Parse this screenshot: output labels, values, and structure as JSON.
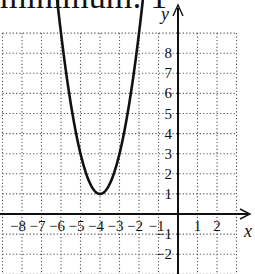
{
  "caption": "minimum: 1",
  "chart_data": {
    "type": "line",
    "title": "",
    "function": "y = 2(x + 4)^2 + 1",
    "vertex": [
      -4,
      1
    ],
    "xlabel": "x",
    "ylabel": "y",
    "xlim": [
      -9,
      3
    ],
    "ylim": [
      -3,
      9
    ],
    "grid": true,
    "x_tick_labels": [
      "-8",
      "-7",
      "-6",
      "-5",
      "-4",
      "-3",
      "-2",
      "-1",
      "1",
      "2"
    ],
    "y_tick_labels": [
      "8",
      "7",
      "6",
      "5",
      "4",
      "3",
      "2",
      "1",
      "-1",
      "-2"
    ],
    "series": [
      {
        "name": "parabola",
        "x": [
          -6.2,
          -6,
          -5.5,
          -5,
          -4.5,
          -4,
          -3.5,
          -3,
          -2.5,
          -2,
          -1.8
        ],
        "y": [
          10.68,
          9,
          5.5,
          3,
          1.5,
          1,
          1.5,
          3,
          5.5,
          9,
          10.68
        ]
      }
    ]
  }
}
